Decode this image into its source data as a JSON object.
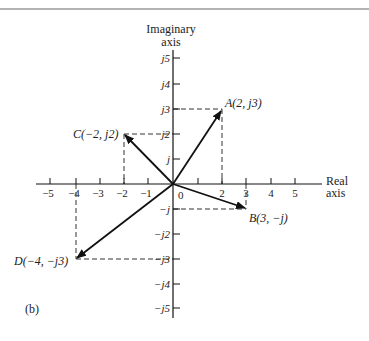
{
  "figure": {
    "panel_label": "(b)",
    "imaginary_axis_label_line1": "Imaginary",
    "imaginary_axis_label_line2": "axis",
    "real_axis_label_line1": "Real",
    "real_axis_label_line2": "axis",
    "origin_label": "0",
    "x_ticks": [
      "−5",
      "−4",
      "−3",
      "−2",
      "−1",
      "1",
      "2",
      "3",
      "4",
      "5"
    ],
    "y_ticks_positive": [
      "j",
      "j2",
      "j3",
      "j4",
      "j5"
    ],
    "y_ticks_negative": [
      "−j",
      "−j2",
      "−j3",
      "−j4",
      "−j5"
    ],
    "points": [
      {
        "name": "A",
        "label": "A(2, j3)",
        "re": 2,
        "im": 3
      },
      {
        "name": "B",
        "label": "B(3, −j)",
        "re": 3,
        "im": -1
      },
      {
        "name": "C",
        "label": "C(−2, j2)",
        "re": -2,
        "im": 2
      },
      {
        "name": "D",
        "label": "D(−4, −j3)",
        "re": -4,
        "im": -3
      }
    ]
  }
}
